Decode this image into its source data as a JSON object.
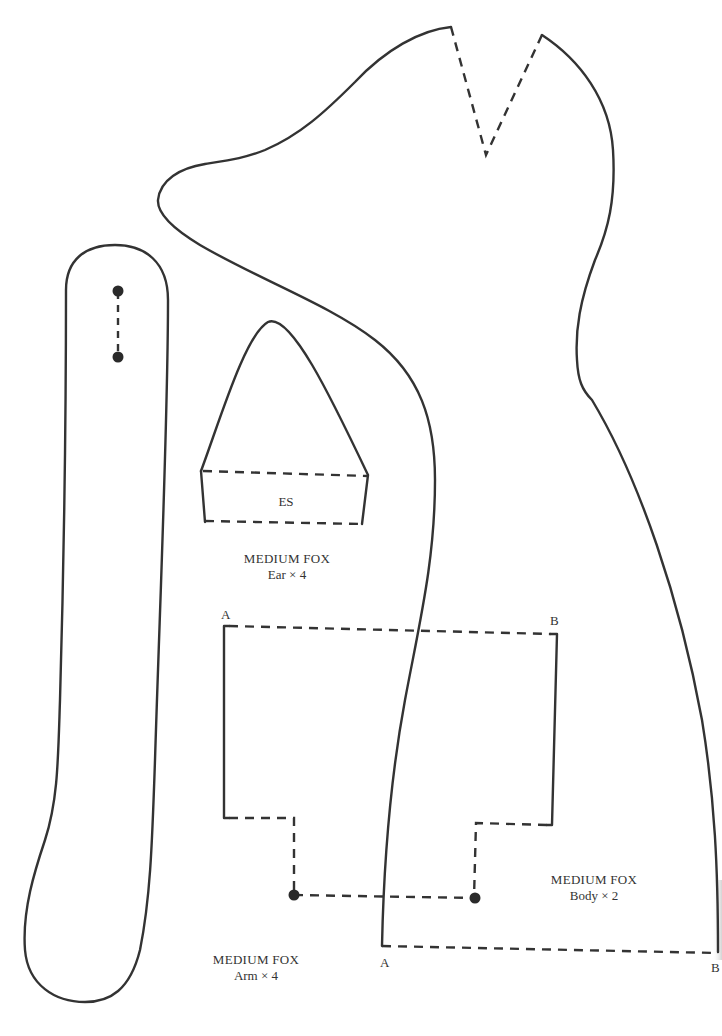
{
  "pattern": {
    "colors": {
      "line": "#333333",
      "background": "#ffffff"
    },
    "pieces": {
      "ear": {
        "name": "MEDIUM FOX",
        "piece": "Ear × 4",
        "inner_label": "ES"
      },
      "arm": {
        "name": "MEDIUM FOX",
        "piece": "Arm × 4"
      },
      "body": {
        "name": "MEDIUM FOX",
        "piece": "Body × 2"
      }
    },
    "markers": {
      "gusset_top_left": "A",
      "gusset_top_right": "B",
      "body_bottom_left": "A",
      "body_bottom_right": "B"
    }
  }
}
